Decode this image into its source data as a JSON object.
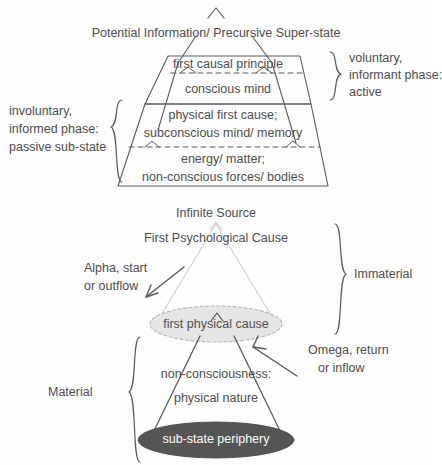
{
  "figure": {
    "title_top": "Potential Information/ Precursive Super-state",
    "palette": {
      "ink": "#4a4a4a",
      "stroke": "#5a5a5a",
      "light_ellipse_fill": "#e6e6e6",
      "light_ellipse_stroke": "#b5b5b5",
      "dark_ellipse_fill": "#555555",
      "dark_ellipse_text": "#ffffff",
      "background": "#fdfdfd",
      "cone_stroke": "#cfcfcf"
    }
  },
  "top_diagram": {
    "name": "stratified-trapezoid",
    "apex_caret": "^",
    "heading": "Potential Information/ Precursive Super-state",
    "bands": [
      {
        "id": "band-1",
        "text": "first causal principle"
      },
      {
        "id": "band-2",
        "text": "conscious mind"
      },
      {
        "id": "band-3",
        "line1": "physical first cause;",
        "line2": "subconscious mind/ memory"
      },
      {
        "id": "band-4",
        "line1": "energy/ matter;",
        "line2": "non-conscious forces/ bodies"
      }
    ],
    "right_bracket": {
      "line1": "voluntary,",
      "line2": "informant phase:",
      "line3": "active"
    },
    "left_bracket": {
      "line1": "involuntary,",
      "line2": "informed phase:",
      "line3": "passive sub-state"
    }
  },
  "bottom_diagram": {
    "name": "double-cone",
    "top_label_1": "Infinite Source",
    "top_label_2": "First Psychological Cause",
    "apex_caret": "^",
    "alpha_label": {
      "line1": "Alpha, start",
      "line2": "or outflow"
    },
    "omega_label": {
      "line1": "Omega, return",
      "line2": "or inflow"
    },
    "middle_ellipse": "first physical cause",
    "middle_caret": "^",
    "mid_label_1": "non-consciousness:",
    "mid_label_2": "physical nature",
    "bottom_ellipse": "sub-state periphery",
    "right_bracket_label": "Immaterial",
    "left_bracket_label": "Material"
  }
}
